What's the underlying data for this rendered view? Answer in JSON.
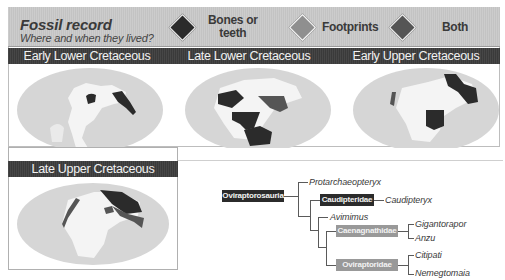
{
  "header": {
    "title": "Fossil record",
    "subtitle": "Where and when they lived?"
  },
  "legend": [
    {
      "label_line1": "Bones or",
      "label_line2": "teeth",
      "color": "#2b2b2b",
      "icon": "diamond-icon"
    },
    {
      "label_line1": "Footprints",
      "label_line2": "",
      "color": "#8f8f8f",
      "icon": "diamond-icon"
    },
    {
      "label_line1": "Both",
      "label_line2": "",
      "color": "#555555",
      "icon": "diamond-icon"
    }
  ],
  "periods": [
    {
      "label": "Early Lower Cretaceous"
    },
    {
      "label": "Late Lower Cretaceous"
    },
    {
      "label": "Early Upper Cretaceous"
    },
    {
      "label": "Late Upper Cretaceous"
    }
  ],
  "colors": {
    "bones": "#2b2b2b",
    "footprints": "#8f8f8f",
    "both": "#555555",
    "ocean": "#d6d6d6",
    "land": "#f4f4f4",
    "header_bg": "#c9c9c9",
    "bar_bg": "#3d3d3d"
  },
  "cladogram": {
    "root": "Oviraptorosauria",
    "taxa": {
      "protarchaeopteryx": "Protarchaeopteryx",
      "caudipteridae": "Caudipteridae",
      "caudipteryx": "Caudipteryx",
      "avimimus": "Avimimus",
      "caenagnathidae": "Caenagnathidae",
      "gigantoraptor": "Gigantorapor",
      "anzu": "Anzu",
      "oviraptoridae": "Oviraptoridae",
      "citipati": "Citipati",
      "nemegtomaia": "Nemegtomaia"
    }
  }
}
